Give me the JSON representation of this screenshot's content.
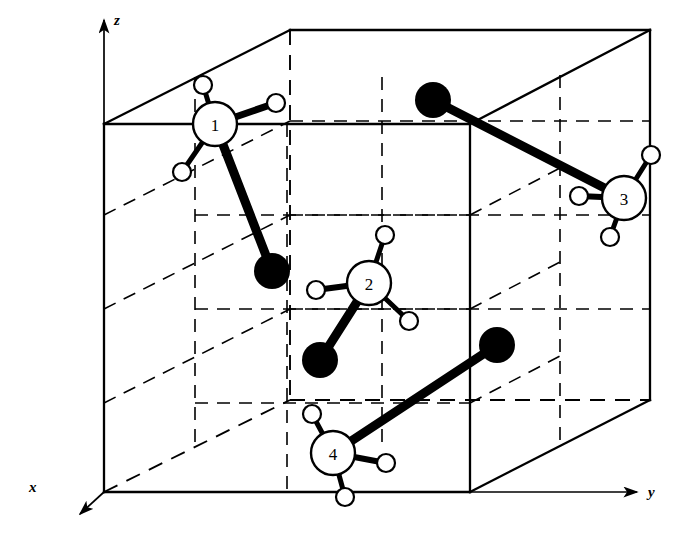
{
  "figure": {
    "background_color": "#ffffff",
    "line_color": "#000000",
    "solid_atom_color": "#000000",
    "open_atom_fill": "#ffffff"
  },
  "axes": [
    {
      "name": "x",
      "label": "x",
      "label_x": 30,
      "label_y": 492,
      "from": [
        104,
        492
      ],
      "to": [
        76,
        517
      ]
    },
    {
      "name": "y",
      "label": "y",
      "label_x": 652,
      "label_y": 493,
      "from": [
        470,
        492
      ],
      "to": [
        639,
        492
      ]
    },
    {
      "name": "z",
      "label": "z",
      "label_x": 118,
      "label_y": 22,
      "from": [
        104,
        124
      ],
      "to": [
        104,
        18
      ]
    }
  ],
  "cell": {
    "shape": "parallelepiped",
    "vertices": {
      "front_top_left": [
        104,
        124
      ],
      "front_top_right": [
        470,
        124
      ],
      "front_bottom_left": [
        104,
        492
      ],
      "front_bottom_right": [
        470,
        492
      ],
      "back_top_left": [
        290,
        30
      ],
      "back_top_right": [
        650,
        30
      ],
      "back_bottom_left": [
        290,
        400
      ],
      "back_bottom_right": [
        650,
        400
      ]
    },
    "solid_edges": [
      [
        [
          104,
          124
        ],
        [
          470,
          124
        ]
      ],
      [
        [
          104,
          124
        ],
        [
          104,
          492
        ]
      ],
      [
        [
          104,
          492
        ],
        [
          470,
          492
        ]
      ],
      [
        [
          470,
          124
        ],
        [
          470,
          492
        ]
      ],
      [
        [
          104,
          124
        ],
        [
          290,
          30
        ]
      ],
      [
        [
          290,
          30
        ],
        [
          650,
          30
        ]
      ],
      [
        [
          650,
          30
        ],
        [
          470,
          124
        ]
      ],
      [
        [
          650,
          30
        ],
        [
          650,
          400
        ]
      ],
      [
        [
          650,
          400
        ],
        [
          470,
          492
        ]
      ]
    ],
    "dashed_edges": [
      [
        [
          104,
          492
        ],
        [
          290,
          400
        ]
      ],
      [
        [
          290,
          400
        ],
        [
          650,
          400
        ]
      ],
      [
        [
          290,
          30
        ],
        [
          290,
          400
        ]
      ]
    ],
    "dashed_interior": [
      [
        [
          104,
          309
        ],
        [
          290,
          215
        ]
      ],
      [
        [
          290,
          215
        ],
        [
          650,
          215
        ]
      ],
      [
        [
          287,
          124
        ],
        [
          287,
          492
        ]
      ],
      [
        [
          104,
          215
        ],
        [
          290,
          121
        ]
      ],
      [
        [
          290,
          121
        ],
        [
          650,
          121
        ]
      ],
      [
        [
          195,
          77
        ],
        [
          195,
          445
        ]
      ],
      [
        [
          382,
          77
        ],
        [
          382,
          445
        ]
      ],
      [
        [
          195,
          309
        ],
        [
          470,
          309
        ]
      ],
      [
        [
          195,
          215
        ],
        [
          470,
          215
        ]
      ],
      [
        [
          470,
          309
        ],
        [
          560,
          262
        ]
      ],
      [
        [
          470,
          215
        ],
        [
          560,
          168
        ]
      ],
      [
        [
          560,
          75
        ],
        [
          560,
          355
        ]
      ],
      [
        [
          104,
          403
        ],
        [
          290,
          309
        ]
      ],
      [
        [
          290,
          309
        ],
        [
          650,
          309
        ]
      ]
    ]
  },
  "molecules": [
    {
      "id": "1",
      "label": "1",
      "center": [
        215,
        124
      ],
      "radius": 22,
      "type": "numbered-open-atom",
      "ligands": [
        {
          "center": [
            203,
            85
          ],
          "radius": 9
        },
        {
          "center": [
            276,
            103
          ],
          "radius": 9
        },
        {
          "center": [
            182,
            172
          ],
          "radius": 9
        }
      ],
      "bonded_solid_atom": {
        "center": [
          272,
          271
        ],
        "radius": 18
      }
    },
    {
      "id": "2",
      "label": "2",
      "center": [
        369,
        283
      ],
      "radius": 22,
      "type": "numbered-open-atom",
      "ligands": [
        {
          "center": [
            385,
            235
          ],
          "radius": 9
        },
        {
          "center": [
            316,
            290
          ],
          "radius": 9
        },
        {
          "center": [
            409,
            321
          ],
          "radius": 9
        }
      ],
      "bonded_solid_atom": {
        "center": [
          320,
          360
        ],
        "radius": 18
      }
    },
    {
      "id": "3",
      "label": "3",
      "center": [
        624,
        198
      ],
      "radius": 22,
      "type": "numbered-open-atom",
      "ligands": [
        {
          "center": [
            651,
            155
          ],
          "radius": 9
        },
        {
          "center": [
            579,
            196
          ],
          "radius": 9
        },
        {
          "center": [
            610,
            237
          ],
          "radius": 9
        }
      ],
      "bonded_solid_atom": {
        "center": [
          433,
          100
        ],
        "radius": 18
      }
    },
    {
      "id": "4",
      "label": "4",
      "center": [
        333,
        453
      ],
      "radius": 22,
      "type": "numbered-open-atom",
      "ligands": [
        {
          "center": [
            312,
            414
          ],
          "radius": 9
        },
        {
          "center": [
            386,
            463
          ],
          "radius": 9
        },
        {
          "center": [
            345,
            497
          ],
          "radius": 9
        }
      ],
      "bonded_solid_atom": {
        "center": [
          497,
          345
        ],
        "radius": 18
      }
    }
  ]
}
